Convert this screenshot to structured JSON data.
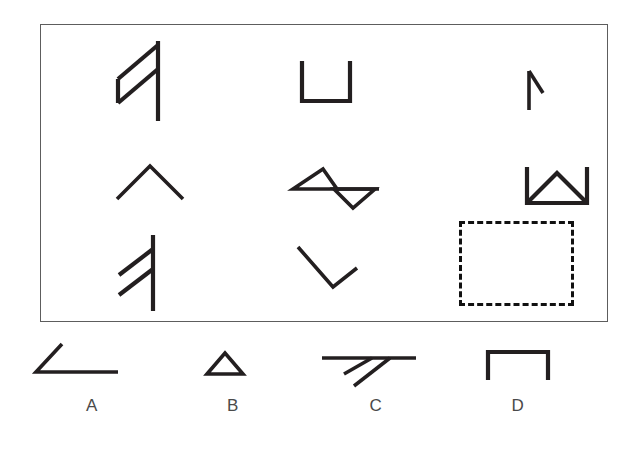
{
  "puzzle": {
    "type": "abstract-reasoning-matrix",
    "title": "",
    "grid": {
      "rows": 3,
      "columns": 3,
      "cells": [
        {
          "position": "row1-col1",
          "icon": "vertical-line-with-two-upleft-diagonals-shape",
          "description": "Vertical stroke with two parallel diagonal strokes attached toward the upper left",
          "empty": false
        },
        {
          "position": "row1-col2",
          "icon": "u-bracket-open-top-shape",
          "description": "Square bracket opening upward (U shape)",
          "empty": false
        },
        {
          "position": "row1-col3",
          "icon": "small-flag-vertical-with-diagonal-shape",
          "description": "Short vertical stroke with a small diagonal from its top toward the lower right",
          "empty": false
        },
        {
          "position": "row2-col1",
          "icon": "caret-up-chevron-shape",
          "description": "Upward pointing chevron, open at the bottom",
          "empty": false
        },
        {
          "position": "row2-col2",
          "icon": "double-triangle-bowtie-shape",
          "description": "Triangle pointing up on the left joined to a triangle pointing down on the right by a horizontal line",
          "empty": false
        },
        {
          "position": "row2-col3",
          "icon": "u-bracket-with-inner-triangle-shape",
          "description": "Square bracket opening upward containing a triangle pointing up",
          "empty": false
        },
        {
          "position": "row3-col1",
          "icon": "vertical-line-with-two-upleft-diagonals-shape",
          "description": "Vertical stroke with two parallel diagonal strokes attached toward the upper left",
          "empty": false
        },
        {
          "position": "row3-col2",
          "icon": "check-mark-v-shape",
          "description": "Long diagonal descending to the right meeting a short diagonal rising to the right",
          "empty": false
        },
        {
          "position": "row3-col3",
          "icon": "dashed-empty-slot",
          "description": "Empty dashed rectangle marking the missing tile",
          "empty": true
        }
      ]
    },
    "options": [
      {
        "label": "A",
        "icon": "angle-diagonal-with-horizontal-shape",
        "description": "Diagonal stroke descending to the right meeting a horizontal stroke, forming an angle"
      },
      {
        "label": "B",
        "icon": "small-triangle-shape",
        "description": "Small triangle pointing up"
      },
      {
        "label": "C",
        "icon": "horizontal-line-with-two-downleft-diagonals-shape",
        "description": "Horizontal stroke with two parallel diagonal strokes below going down to the left"
      },
      {
        "label": "D",
        "icon": "n-bracket-open-bottom-shape",
        "description": "Square bracket opening downward (inverted U shape)"
      }
    ]
  },
  "colors": {
    "ink": "#231f20",
    "frame": "#5d5d5d",
    "label": "#4a4a4a",
    "background": "#ffffff",
    "dashed_outline": "#111111"
  }
}
